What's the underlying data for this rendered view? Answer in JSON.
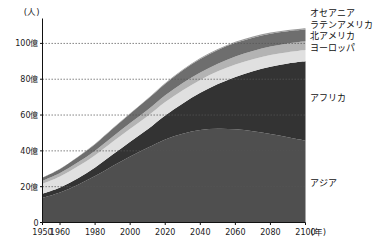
{
  "chart_data": {
    "type": "area",
    "stacked": true,
    "title": "",
    "xlabel": "年",
    "ylabel": "(人)",
    "yunit_label": "(人)",
    "xunit_label": "(年)",
    "xlim": [
      1950,
      2100
    ],
    "ylim": [
      0,
      110
    ],
    "y_tick_values": [
      0,
      20,
      40,
      60,
      80,
      100
    ],
    "y_tick_labels": [
      "0",
      "20億",
      "40億",
      "60億",
      "80億",
      "100億"
    ],
    "x_tick_values": [
      1950,
      1960,
      1980,
      2000,
      2020,
      2040,
      2060,
      2080,
      2100
    ],
    "x_tick_labels": [
      "1950",
      "1960",
      "1980",
      "2000",
      "2020",
      "2040",
      "2060",
      "2080",
      "2100"
    ],
    "grid": true,
    "grid_style": "dotted-horizontal",
    "legend_position": "right-outside-top",
    "x": [
      1950,
      1960,
      1970,
      1980,
      1990,
      2000,
      2010,
      2020,
      2030,
      2040,
      2050,
      2060,
      2070,
      2080,
      2090,
      2100
    ],
    "series": [
      {
        "name": "アジア",
        "label": "アジア",
        "color": "#4f4f4f",
        "label_position": "inside-right",
        "values": [
          13.8,
          16.8,
          21.0,
          25.9,
          31.6,
          36.9,
          41.7,
          46.4,
          49.6,
          51.6,
          52.3,
          52.0,
          50.9,
          49.4,
          47.6,
          45.7
        ]
      },
      {
        "name": "アフリカ",
        "label": "アフリカ",
        "color": "#333333",
        "label_position": "inside-right",
        "values": [
          2.3,
          2.8,
          3.6,
          4.8,
          6.3,
          8.2,
          10.4,
          13.4,
          16.9,
          20.8,
          25.0,
          29.3,
          33.6,
          37.6,
          41.2,
          44.3
        ]
      },
      {
        "name": "ヨーロッパ",
        "label": "ヨーロッパ",
        "color": "#e0e0e0",
        "label_position": "legend",
        "values": [
          5.5,
          6.1,
          6.6,
          6.9,
          7.2,
          7.3,
          7.4,
          7.5,
          7.4,
          7.2,
          7.1,
          6.9,
          6.7,
          6.5,
          6.3,
          6.3
        ]
      },
      {
        "name": "北アメリカ",
        "label": "北アメリカ",
        "color": "#b3b3b3",
        "label_position": "legend",
        "values": [
          1.7,
          2.0,
          2.3,
          2.5,
          2.8,
          3.1,
          3.4,
          3.7,
          4.0,
          4.2,
          4.3,
          4.5,
          4.6,
          4.8,
          4.9,
          4.9
        ]
      },
      {
        "name": "ラテンアメリカ",
        "label": "ラテンアメリカ",
        "color": "#6e6e6e",
        "label_position": "legend",
        "values": [
          1.7,
          2.2,
          2.9,
          3.6,
          4.4,
          5.2,
          6.0,
          6.5,
          7.1,
          7.5,
          7.6,
          7.6,
          7.4,
          7.1,
          6.8,
          6.5
        ]
      },
      {
        "name": "オセアニア",
        "label": "オセアニア",
        "color": "#9a9a9a",
        "label_position": "legend",
        "values": [
          0.13,
          0.16,
          0.2,
          0.23,
          0.27,
          0.31,
          0.37,
          0.43,
          0.48,
          0.53,
          0.57,
          0.61,
          0.65,
          0.68,
          0.71,
          0.73
        ]
      }
    ],
    "legend_entries": [
      {
        "label": "オセアニア",
        "color": "#9a9a9a"
      },
      {
        "label": "ラテンアメリカ",
        "color": "#6e6e6e"
      },
      {
        "label": "北アメリカ",
        "color": "#b3b3b3"
      },
      {
        "label": "ヨーロッパ",
        "color": "#e0e0e0"
      }
    ],
    "inner_labels": [
      {
        "label": "アフリカ",
        "color": "#333333"
      },
      {
        "label": "アジア",
        "color": "#4f4f4f"
      }
    ]
  }
}
